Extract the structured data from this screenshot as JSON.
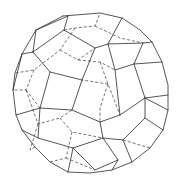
{
  "figure": {
    "title": "",
    "edge_color": "#2a2a2a",
    "background": "#ffffff",
    "edge_styles": [
      "solid-visible",
      "dashed-hidden"
    ]
  }
}
